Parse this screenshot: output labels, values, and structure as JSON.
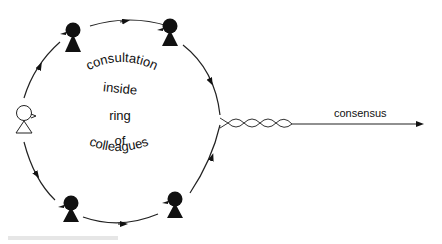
{
  "diagram": {
    "ring_labels": [
      "consultation",
      "inside",
      "ring",
      "of",
      "colleagues"
    ],
    "output_label": "consensus",
    "figures": [
      {
        "role": "proposer",
        "style": "outline"
      },
      {
        "role": "colleague",
        "style": "solid",
        "position": "top-left"
      },
      {
        "role": "colleague",
        "style": "solid",
        "position": "top-right"
      },
      {
        "role": "colleague",
        "style": "solid",
        "position": "bottom-left"
      },
      {
        "role": "colleague",
        "style": "solid",
        "position": "bottom-right"
      }
    ],
    "colors": {
      "ink": "#111111",
      "background": "#ffffff"
    }
  }
}
